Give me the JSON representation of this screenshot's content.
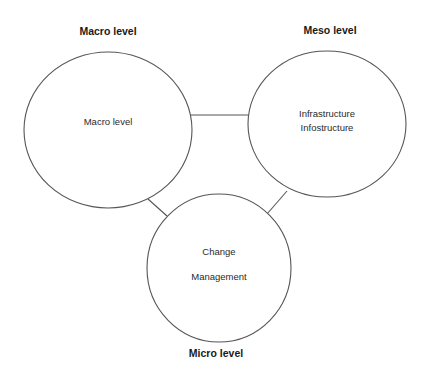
{
  "diagram": {
    "type": "three-level relationship diagram",
    "stroke_color": "#555555",
    "background": "#ffffff",
    "level_titles": {
      "macro": "Macro level",
      "meso": "Meso level",
      "micro": "Micro level"
    },
    "nodes": [
      {
        "id": "macro",
        "lines": [
          "Macro level"
        ]
      },
      {
        "id": "meso",
        "lines": [
          "Infrastructure",
          "Infostructure"
        ]
      },
      {
        "id": "micro",
        "lines": [
          "Change",
          "Management"
        ]
      }
    ],
    "edges": [
      {
        "from": "macro",
        "to": "meso"
      },
      {
        "from": "macro",
        "to": "micro"
      },
      {
        "from": "meso",
        "to": "micro"
      }
    ]
  }
}
